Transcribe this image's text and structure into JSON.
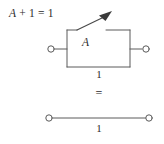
{
  "figure": {
    "name": "boolean-switching-identity-a-plus-1",
    "background_color": "#ffffff",
    "line_color": "#5a5a5a",
    "text_color": "#2b2b2b",
    "equation": {
      "variable": "A",
      "rest": " + 1 = 1",
      "full": "A + 1 = 1"
    },
    "top_circuit": {
      "switch_label": "A",
      "value_label": "1",
      "left_terminal": "open-terminal",
      "right_terminal": "open-terminal",
      "switch_state": "open"
    },
    "equals_sign": "=",
    "bottom_circuit": {
      "value_label": "1",
      "left_terminal": "open-terminal",
      "right_terminal": "open-terminal",
      "wire_state": "closed"
    }
  }
}
